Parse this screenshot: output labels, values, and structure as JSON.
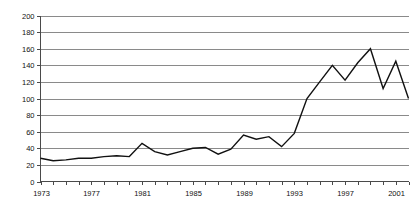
{
  "chart_data": {
    "type": "line",
    "title": "",
    "subtitle": "",
    "xlabel": "",
    "ylabel": "",
    "grid": true,
    "legend": false,
    "legend_position": "none",
    "xlim": [
      1973,
      2002
    ],
    "ylim": [
      0,
      200
    ],
    "y_tick_step": 20,
    "x_tick_step": 1,
    "x_label_step": 4,
    "series_color": "#111111",
    "gridline_color": "#8a8a8a",
    "axis_color": "#4a4a4a",
    "y_ticks": [
      0,
      20,
      40,
      60,
      80,
      100,
      120,
      140,
      160,
      180,
      200
    ],
    "y_tick_labels": [
      "0",
      "20",
      "40",
      "60",
      "80",
      "100",
      "120",
      "140",
      "160",
      "180",
      "200"
    ],
    "x_ticks": [
      1973,
      1974,
      1975,
      1976,
      1977,
      1978,
      1979,
      1980,
      1981,
      1982,
      1983,
      1984,
      1985,
      1986,
      1987,
      1988,
      1989,
      1990,
      1991,
      1992,
      1993,
      1994,
      1995,
      1996,
      1997,
      1998,
      1999,
      2000,
      2001,
      2002
    ],
    "x_tick_labels": [
      "1973",
      "",
      "",
      "",
      "1977",
      "",
      "",
      "",
      "1981",
      "",
      "",
      "",
      "1985",
      "",
      "",
      "",
      "1989",
      "",
      "",
      "",
      "1993",
      "",
      "",
      "",
      "1997",
      "",
      "",
      "",
      "2001",
      ""
    ],
    "x": [
      1973,
      1974,
      1975,
      1976,
      1977,
      1978,
      1979,
      1980,
      1981,
      1982,
      1983,
      1984,
      1985,
      1986,
      1987,
      1988,
      1989,
      1990,
      1991,
      1992,
      1993,
      1994,
      1995,
      1996,
      1997,
      1998,
      1999,
      2000,
      2001,
      2002
    ],
    "values": [
      28,
      25,
      26,
      28,
      28,
      30,
      31,
      30,
      46,
      36,
      32,
      36,
      40,
      41,
      33,
      39,
      56,
      51,
      54,
      42,
      58,
      100,
      120,
      140,
      122,
      143,
      160,
      112,
      145,
      100
    ],
    "series": [
      {
        "name": "series-1",
        "color": "#111111",
        "values": [
          28,
          25,
          26,
          28,
          28,
          30,
          31,
          30,
          46,
          36,
          32,
          36,
          40,
          41,
          33,
          39,
          56,
          51,
          54,
          42,
          58,
          100,
          120,
          140,
          122,
          143,
          160,
          112,
          145,
          100
        ]
      }
    ]
  }
}
